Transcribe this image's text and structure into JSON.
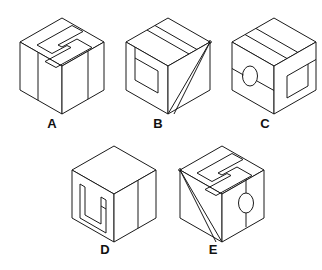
{
  "figure": {
    "background_color": "#ffffff",
    "line_color": "#1a1a1a",
    "label_color": "#111111",
    "item_count": 5
  },
  "items": [
    {
      "label": "A",
      "label_x": 52,
      "label_y": 128,
      "cube_origin_x": 20,
      "cube_origin_y": 18,
      "top_face_marking": "s-shape-outline",
      "left_face_marking": "vertical-band-line",
      "right_face_marking": "vertical-band-line",
      "has_ellipse": "no",
      "has_diagonal": "no"
    },
    {
      "label": "B",
      "label_x": 158,
      "label_y": 128,
      "cube_origin_x": 126,
      "cube_origin_y": 18,
      "top_face_marking": "diagonal-band",
      "left_face_marking": "rectangle-outline",
      "right_face_marking": "two-diagonals-to-bottom-vertex",
      "has_ellipse": "no",
      "has_diagonal": "yes"
    },
    {
      "label": "C",
      "label_x": 265,
      "label_y": 128,
      "cube_origin_x": 232,
      "cube_origin_y": 18,
      "top_face_marking": "horizontal-band",
      "left_face_marking": "ellipse-with-crossing-line",
      "right_face_marking": "rectangle-outline-with-line",
      "has_ellipse": "yes",
      "has_diagonal": "no"
    },
    {
      "label": "D",
      "label_x": 105,
      "label_y": 254,
      "cube_origin_x": 72,
      "cube_origin_y": 146,
      "top_face_marking": "plain",
      "left_face_marking": "s-shape-outline",
      "right_face_marking": "vertical-band-line",
      "has_ellipse": "no",
      "has_diagonal": "no"
    },
    {
      "label": "E",
      "label_x": 213,
      "label_y": 254,
      "cube_origin_x": 180,
      "cube_origin_y": 146,
      "top_face_marking": "s-shape-outline",
      "left_face_marking": "two-diagonals-to-bottom-vertex",
      "right_face_marking": "ellipse-with-vertical-band",
      "has_ellipse": "yes",
      "has_diagonal": "yes"
    }
  ],
  "labels": {
    "a": "A",
    "b": "B",
    "c": "C",
    "d": "D",
    "e": "E"
  }
}
